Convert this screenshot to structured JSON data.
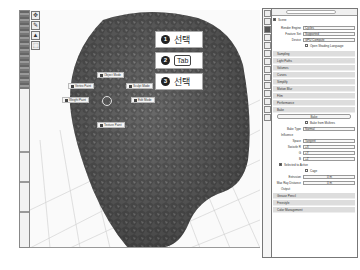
{
  "toolbar": {
    "tools": [
      {
        "name": "move-icon",
        "glyph": "✥"
      },
      {
        "name": "brush-icon",
        "glyph": "✎"
      },
      {
        "name": "select-icon",
        "glyph": "▲"
      },
      {
        "name": "box-select-icon",
        "glyph": "⬚"
      }
    ]
  },
  "pie_menu": {
    "items": [
      {
        "label": "Object Mode"
      },
      {
        "label": "Vertex Paint"
      },
      {
        "label": "Sculpt Mode"
      },
      {
        "label": "Weight Paint"
      },
      {
        "label": "Edit Mode"
      },
      {
        "label": "Texture Paint"
      }
    ]
  },
  "callouts": [
    {
      "num": "1",
      "text": "선택"
    },
    {
      "num": "2",
      "key": "Tab"
    },
    {
      "num": "3",
      "text": "선택"
    }
  ],
  "panel": {
    "scene_label": "Scene",
    "fields": [
      {
        "label": "Render Engine",
        "value": "Cycles"
      },
      {
        "label": "Feature Set",
        "value": "Supported"
      },
      {
        "label": "Device",
        "value": "GPU Compute"
      }
    ],
    "osl_label": "Open Shading Language",
    "sections_top": [
      "Sampling",
      "Light Paths",
      "Volumes",
      "Curves",
      "Simplify",
      "Motion Blur",
      "Film",
      "Performance",
      "Bake"
    ],
    "bake": {
      "button": "Bake",
      "multires_label": "Bake from Multires",
      "bake_type_label": "Bake Type",
      "bake_type_value": "Normal",
      "influence_label": "Influence",
      "space_label": "Space",
      "space_value": "Tangent",
      "swizzle_r_label": "Swizzle R",
      "swizzle_r_value": "+X",
      "g_label": "G",
      "g_value": "+Y",
      "b_label": "B",
      "b_value": "+Z",
      "selected_label": "Selected to Active",
      "cage_label": "Cage",
      "extrusion_label": "Extrusion",
      "extrusion_value": "0 m",
      "max_ray_label": "Max Ray Distance",
      "max_ray_value": "0 m",
      "output_label": "Output"
    },
    "sections_bottom": [
      "Grease Pencil",
      "Freestyle",
      "Color Management"
    ]
  }
}
